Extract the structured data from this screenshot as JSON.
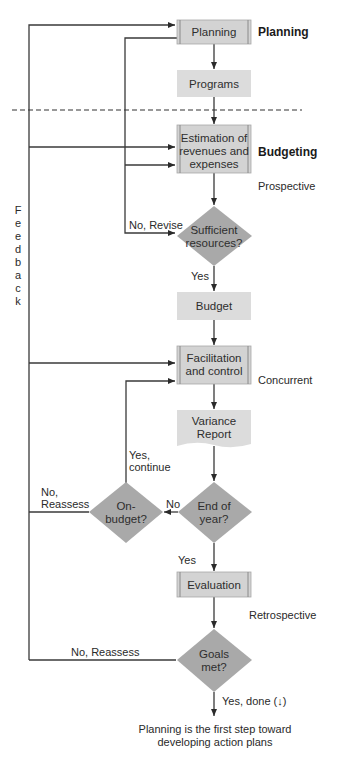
{
  "diagram": {
    "nodes": {
      "planning": {
        "label": "Planning",
        "shape": "process"
      },
      "programs": {
        "label": "Programs",
        "shape": "rect"
      },
      "estimation": {
        "lines": [
          "Estimation of",
          "revenues and",
          "expenses"
        ],
        "shape": "process"
      },
      "sufficient": {
        "lines": [
          "Sufficient",
          "resources?"
        ],
        "shape": "decision"
      },
      "budget": {
        "label": "Budget",
        "shape": "rect"
      },
      "facilitation": {
        "lines": [
          "Facilitation",
          "and control"
        ],
        "shape": "process"
      },
      "variance": {
        "lines": [
          "Variance",
          "Report"
        ],
        "shape": "document"
      },
      "end_of_year": {
        "lines": [
          "End of",
          "year?"
        ],
        "shape": "decision"
      },
      "on_budget": {
        "lines": [
          "On-",
          "budget?"
        ],
        "shape": "decision"
      },
      "evaluation": {
        "label": "Evaluation",
        "shape": "process"
      },
      "goals_met": {
        "lines": [
          "Goals",
          "met?"
        ],
        "shape": "decision"
      }
    },
    "phase_labels": {
      "planning": "Planning",
      "budgeting": "Budgeting",
      "prospective": "Prospective",
      "concurrent": "Concurrent",
      "retrospective": "Retrospective"
    },
    "edge_labels": {
      "no_revise": "No, Revise",
      "yes_budget": "Yes",
      "yes_continue": [
        "Yes,",
        "continue"
      ],
      "no_end_year": "No",
      "no_reassess_onbudget": [
        "No,",
        "Reassess"
      ],
      "yes_evaluation": "Yes",
      "no_reassess_goals": "No, Reassess",
      "yes_done": "Yes, done (↓)"
    },
    "feedback_letters": [
      "F",
      "e",
      "e",
      "d",
      "b",
      "a",
      "c",
      "k"
    ],
    "caption": [
      "Planning is the first step toward",
      "developing action plans"
    ],
    "colors": {
      "box_fill": "#d3d3d3",
      "box_border": "#9a9a9a",
      "diamond_fill": "#a9a9a9",
      "line": "#3a3a3a"
    }
  }
}
